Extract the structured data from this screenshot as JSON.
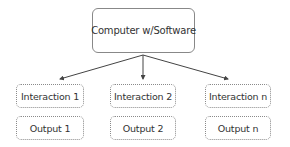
{
  "diagram": {
    "root": {
      "label": "Computer w/Software"
    },
    "columns": [
      {
        "interaction": "Interaction 1",
        "output": "Output 1"
      },
      {
        "interaction": "Interaction 2",
        "output": "Output 2"
      },
      {
        "interaction": "Interaction n",
        "output": "Output n"
      }
    ],
    "colors": {
      "text": "#333333",
      "border": "#888888",
      "arrow": "#444444"
    }
  }
}
